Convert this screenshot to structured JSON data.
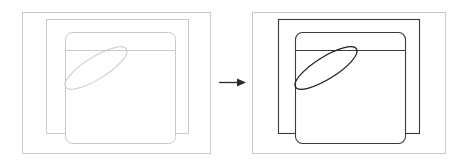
{
  "figure": {
    "type": "diagram",
    "title": "",
    "canvas": {
      "width": 469,
      "height": 165,
      "background": "#ffffff"
    },
    "panels": [
      {
        "id": "left-panel",
        "role": "before",
        "stroke_color": "#c9c9c9",
        "stroke_width": 1,
        "shapes": [
          {
            "name": "outer-rectangle",
            "kind": "rect",
            "x": 22,
            "y": 12,
            "width": 188,
            "height": 141,
            "rx": 0
          },
          {
            "name": "middle-rectangle",
            "kind": "rect",
            "x": 46,
            "y": 19,
            "width": 142,
            "height": 114,
            "rx": 0
          },
          {
            "name": "inner-rounded-rectangle",
            "kind": "rect",
            "x": 65,
            "y": 32,
            "width": 110,
            "height": 111,
            "rx": 7
          },
          {
            "name": "header-divider",
            "kind": "line",
            "x1": 65,
            "y1": 50,
            "x2": 175,
            "y2": 50
          },
          {
            "name": "tilted-ellipse",
            "kind": "ellipse",
            "cx": 96,
            "cy": 68,
            "rx": 36,
            "ry": 11,
            "rotation": -32
          }
        ]
      },
      {
        "id": "right-panel",
        "role": "after",
        "stroke_color": "#3a3a3a",
        "outer_stroke_color": "#c9c9c9",
        "stroke_width": 1.1,
        "shapes": [
          {
            "name": "outer-rectangle",
            "kind": "rect",
            "x": 252,
            "y": 12,
            "width": 193,
            "height": 141,
            "rx": 0
          },
          {
            "name": "middle-rectangle",
            "kind": "rect",
            "x": 278,
            "y": 19,
            "width": 141,
            "height": 114,
            "rx": 0
          },
          {
            "name": "inner-rounded-rectangle",
            "kind": "rect",
            "x": 295,
            "y": 32,
            "width": 110,
            "height": 111,
            "rx": 7
          },
          {
            "name": "header-divider",
            "kind": "line",
            "x1": 295,
            "y1": 50,
            "x2": 405,
            "y2": 50
          },
          {
            "name": "tilted-ellipse",
            "kind": "ellipse",
            "cx": 326,
            "cy": 68,
            "rx": 36,
            "ry": 11,
            "rotation": -32
          }
        ]
      }
    ],
    "connector": {
      "name": "transition-arrow",
      "kind": "arrow",
      "direction": "right",
      "x1": 219,
      "y1": 82,
      "x2": 246,
      "y2": 82,
      "color": "#2b2b2b",
      "head_width": 9,
      "head_height": 8,
      "label": ""
    }
  }
}
